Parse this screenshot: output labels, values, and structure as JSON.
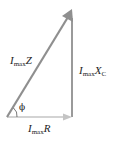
{
  "diagram": {
    "type": "phasor-triangle",
    "vectors": [
      {
        "name": "resistive",
        "label_main": "I",
        "label_sub": "max",
        "label_var": "R",
        "direction": "horizontal-right",
        "color": "#bfbfbf"
      },
      {
        "name": "capacitive",
        "label_main": "I",
        "label_sub": "max",
        "label_var": "X",
        "label_var_sub": "C",
        "direction": "vertical",
        "color": "#999999"
      },
      {
        "name": "impedance",
        "label_main": "I",
        "label_sub": "max",
        "label_var": "Z",
        "direction": "hypotenuse-up-right",
        "color": "#8c8c8c"
      }
    ],
    "angle_label": "ϕ"
  }
}
